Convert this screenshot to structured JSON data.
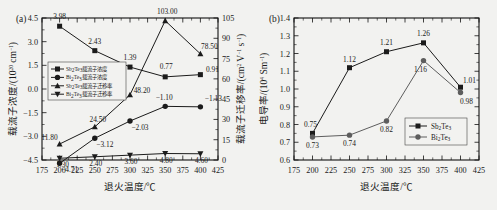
{
  "figure": {
    "background": "#f2f2f0",
    "ink": "#1b1b1b",
    "grey": "#5d5d5d"
  },
  "panel_a": {
    "panel_label": "(a)",
    "xlabel": "退火温度/℃",
    "ylabel_left_pre": "载流子浓度/(10",
    "ylabel_left_sup": "20",
    "ylabel_left_post": " cm",
    "ylabel_left_sup2": "−1",
    "ylabel_left_end": ")",
    "ylabel_right_pre": "载流子迁移率/(cm",
    "ylabel_right_sup": "2",
    "ylabel_right_mid": " V",
    "ylabel_right_sup2": "−1",
    "ylabel_right_mid2": " s",
    "ylabel_right_sup3": "−1",
    "ylabel_right_end": ")",
    "xticks": [
      175,
      200,
      225,
      250,
      275,
      300,
      325,
      350,
      375,
      400,
      425
    ],
    "xlim": [
      175,
      425
    ],
    "yticks_left": [
      "4.5",
      "3.0",
      "1.5",
      "0.0",
      "−1.5",
      "−3.0",
      "−4.5"
    ],
    "ylim_left": [
      -4.5,
      4.5
    ],
    "yticks_right": [
      "0",
      "15",
      "30",
      "45",
      "60",
      "75",
      "90",
      "105"
    ],
    "ylim_right": [
      0,
      105
    ],
    "legend": [
      {
        "marker": "square",
        "label_pre": "Sb",
        "label_sub": "2",
        "label_mid": "Te",
        "label_sub2": "3",
        "label_post": "载流子浓度"
      },
      {
        "marker": "circle",
        "label_pre": "Bi",
        "label_sub": "2",
        "label_mid": "Te",
        "label_sub2": "3",
        "label_post": "载流子浓度"
      },
      {
        "marker": "triangle",
        "label_pre": "Sb",
        "label_sub": "2",
        "label_mid": "Te",
        "label_sub2": "3",
        "label_post": "载流子迁移率"
      },
      {
        "marker": "tridown",
        "label_pre": "Bi",
        "label_sub": "2",
        "label_mid": "Te",
        "label_sub2": "3",
        "label_post": "载流子迁移率"
      }
    ]
  },
  "panel_b": {
    "panel_label": "(b)",
    "xlabel": "退火温度/℃",
    "ylabel_pre": "电导率/(10",
    "ylabel_sup": "4",
    "ylabel_post": " Sm",
    "ylabel_sup2": "−1",
    "ylabel_end": ")",
    "xticks": [
      175,
      200,
      225,
      250,
      275,
      300,
      325,
      350,
      375,
      400,
      425
    ],
    "xlim": [
      175,
      425
    ],
    "yticks": [
      "0.6",
      "0.7",
      "0.8",
      "0.9",
      "1.0",
      "1.1",
      "1.2",
      "1.3",
      "1.4"
    ],
    "ylim": [
      0.6,
      1.4
    ],
    "legend": [
      {
        "marker": "square",
        "label_pre": "Sb",
        "label_sub": "2",
        "label_mid": "Te",
        "label_sub2": "3"
      },
      {
        "marker": "circle",
        "label_pre": "Bi",
        "label_sub": "2",
        "label_mid": "Te",
        "label_sub2": "3"
      }
    ]
  },
  "chart_data": [
    {
      "type": "line",
      "panel": "(a)",
      "title": "",
      "xlabel": "退火温度/℃",
      "ylabel": "载流子浓度/(10^20 cm^-1)",
      "ylabel_secondary": "载流子迁移率/(cm^2 V^-1 s^-1)",
      "x": [
        200,
        250,
        300,
        350,
        400
      ],
      "xlim": [
        175,
        425
      ],
      "ylim": [
        -4.5,
        4.5
      ],
      "ylim_secondary": [
        0,
        105
      ],
      "grid": false,
      "legend_position": "left-middle",
      "series": [
        {
          "name": "Sb2Te3载流子浓度",
          "axis": "left",
          "marker": "square",
          "color": "#1b1b1b",
          "values": [
            3.98,
            2.43,
            1.39,
            0.77,
            0.91
          ],
          "labels": [
            "3.98",
            "2.43",
            "1.39",
            "0.77",
            "0.91"
          ]
        },
        {
          "name": "Bi2Te3载流子浓度",
          "axis": "left",
          "marker": "circle",
          "color": "#1b1b1b",
          "values": [
            -4.71,
            -3.12,
            -2.03,
            -1.1,
            -1.13
          ],
          "labels": [
            "−4.71",
            "−3.12",
            "−2.03",
            "−1.10",
            "−1.13"
          ]
        },
        {
          "name": "Sb2Te3载流子迁移率",
          "axis": "right",
          "marker": "triangle",
          "color": "#1b1b1b",
          "values": [
            11.8,
            24.5,
            48.2,
            103.0,
            78.5
          ],
          "labels": [
            "11.80",
            "24.50",
            "48.20",
            "103.00",
            "78.50"
          ]
        },
        {
          "name": "Bi2Te3载流子迁移率",
          "axis": "right",
          "marker": "tridown",
          "color": "#1b1b1b",
          "values": [
            1.3,
            2.4,
            3.6,
            4.8,
            4.6
          ],
          "labels": [
            "1.30",
            "2.40",
            "3.60",
            "4.80",
            "4.60"
          ]
        }
      ]
    },
    {
      "type": "line",
      "panel": "(b)",
      "title": "",
      "xlabel": "退火温度/℃",
      "ylabel": "电导率/(10^4 Sm^-1)",
      "x": [
        200,
        250,
        300,
        350,
        400
      ],
      "xlim": [
        175,
        425
      ],
      "ylim": [
        0.6,
        1.4
      ],
      "grid": false,
      "legend_position": "lower-right",
      "series": [
        {
          "name": "Sb2Te3",
          "marker": "square",
          "color": "#1b1b1b",
          "values": [
            0.75,
            1.12,
            1.21,
            1.26,
            1.01
          ],
          "labels": [
            "0.75",
            "1.12",
            "1.21",
            "1.26",
            "1.01"
          ]
        },
        {
          "name": "Bi2Te3",
          "marker": "circle",
          "color": "#5d5d5d",
          "values": [
            0.73,
            0.74,
            0.82,
            1.16,
            0.98
          ],
          "labels": [
            "0.73",
            "0.74",
            "0.82",
            "1.16",
            "0.98"
          ]
        }
      ]
    }
  ]
}
